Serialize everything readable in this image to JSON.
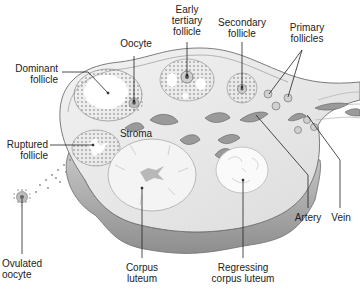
{
  "diagram": {
    "labels": {
      "dominant_follicle": [
        "Dominant",
        "follicle"
      ],
      "oocyte": [
        "Oocyte"
      ],
      "early_tertiary_follicle": [
        "Early",
        "tertiary",
        "follicle"
      ],
      "secondary_follicle": [
        "Secondary",
        "follicle"
      ],
      "primary_follicles": [
        "Primary",
        "follicles"
      ],
      "stroma": [
        "Stroma"
      ],
      "ruptured_follicle": [
        "Ruptured",
        "follicle"
      ],
      "ovulated_oocyte": [
        "Ovulated",
        "oocyte"
      ],
      "corpus_luteum": [
        "Corpus",
        "luteum"
      ],
      "regressing_corpus_luteum": [
        "Regressing",
        "corpus luteum"
      ],
      "artery": [
        "Artery"
      ],
      "vein": [
        "Vein"
      ]
    },
    "colors": {
      "background": "#ffffff",
      "tissue_fill": "#e9e9e9",
      "capsule_shade": "#9a9a9a",
      "outline": "#6e6e6e",
      "granulosa_dots": "#7a7a7a",
      "vessel": "#8a8a8a",
      "leader_line": "#222222",
      "text": "#222222"
    }
  }
}
